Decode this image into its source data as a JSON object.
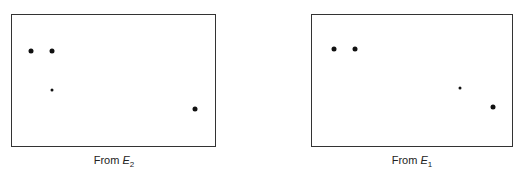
{
  "panels": [
    {
      "id": "left",
      "caption_prefix": "From ",
      "caption_var": "E",
      "caption_sub": "2",
      "dots": [
        {
          "size": "big"
        },
        {
          "size": "big"
        },
        {
          "size": "small"
        },
        {
          "size": "big"
        }
      ]
    },
    {
      "id": "right",
      "caption_prefix": "From ",
      "caption_var": "E",
      "caption_sub": "1",
      "dots": [
        {
          "size": "big"
        },
        {
          "size": "big"
        },
        {
          "size": "small"
        },
        {
          "size": "big"
        }
      ]
    }
  ]
}
